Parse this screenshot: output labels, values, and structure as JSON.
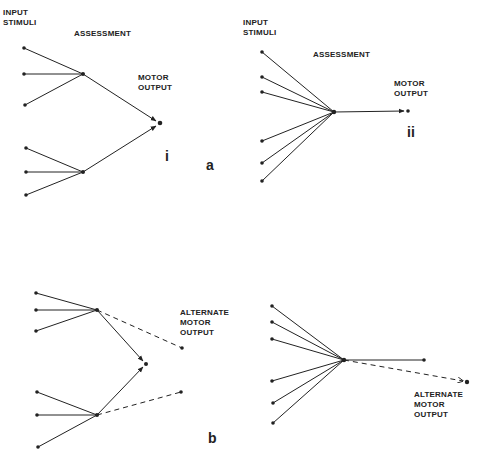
{
  "panel_a": {
    "letter": "a",
    "diagram_i": {
      "numeral": "i",
      "input_label": "INPUT\nSTIMULI",
      "assessment_label": "ASSESSMENT",
      "motor_label": "MOTOR\nOUTPUT"
    },
    "diagram_ii": {
      "numeral": "ii",
      "input_label": "INPUT\nSTIMULI",
      "assessment_label": "ASSESSMENT",
      "motor_label": "MOTOR\nOUTPUT"
    }
  },
  "panel_b": {
    "letter": "b",
    "left": {
      "alternate_label": "ALTERNATE\nMOTOR\nOUTPUT"
    },
    "right": {
      "alternate_label": "ALTERNATE\nMOTOR\nOUTPUT"
    }
  },
  "colors": {
    "ink": "#222222",
    "background": "#ffffff"
  }
}
